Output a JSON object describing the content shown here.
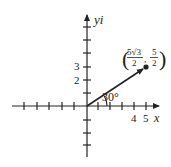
{
  "diagram": {
    "axes": {
      "x_label": "x",
      "y_label": "yi",
      "x_tick_labels": [
        "4",
        "5"
      ],
      "y_tick_labels": [
        "2",
        "3"
      ]
    },
    "vector": {
      "angle_label": "30°",
      "point_label": {
        "x_num": "5√3",
        "x_den": "2",
        "y_num": "5",
        "y_den": "2"
      }
    },
    "colors": {
      "ink": "#222222",
      "background": "#ffffff"
    }
  }
}
